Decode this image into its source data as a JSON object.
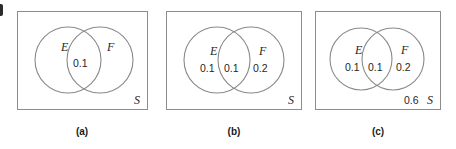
{
  "figure": {
    "background_color": "#ffffff",
    "line_color": "#8a8a8a",
    "text_color": "#1f1f1f"
  },
  "panels": [
    {
      "id": "a",
      "caption": "(a)",
      "sample_space_label": "S",
      "left_set_label": "E",
      "right_set_label": "F",
      "left_only_value": "",
      "intersection_value": "0.1",
      "right_only_value": "",
      "outside_value": ""
    },
    {
      "id": "b",
      "caption": "(b)",
      "sample_space_label": "S",
      "left_set_label": "E",
      "right_set_label": "F",
      "left_only_value": "0.1",
      "intersection_value": "0.1",
      "right_only_value": "0.2",
      "outside_value": ""
    },
    {
      "id": "c",
      "caption": "(c)",
      "sample_space_label": "S",
      "left_set_label": "E",
      "right_set_label": "F",
      "left_only_value": "0.1",
      "intersection_value": "0.1",
      "right_only_value": "0.2",
      "outside_value": "0.6"
    }
  ]
}
